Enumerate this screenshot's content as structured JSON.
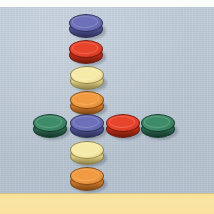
{
  "scene": {
    "title": "Checkers pieces arranged in a cross on a blue-grey table",
    "width": 214,
    "height": 214,
    "background_color": "#b7c4d1",
    "top_band_color": "#fcfdfd",
    "bottom_band_color": "#f9e2a0",
    "top_band_height": 7,
    "bottom_band_top": 193,
    "bottom_band_height": 21
  },
  "palette": {
    "blue": "#6d70b8",
    "blue_dark": "#4b4e8c",
    "blue_outline": "#2d2f55",
    "red": "#e8442c",
    "red_dark": "#b32a17",
    "red_outline": "#6f1a0d",
    "cream": "#f6eaa8",
    "cream_dark": "#d9c97f",
    "cream_outline": "#8d8248",
    "orange": "#f09a41",
    "orange_dark": "#c9752a",
    "orange_outline": "#7d4613",
    "green": "#3f8c6a",
    "green_dark": "#2a6149",
    "green_outline": "#15392a"
  },
  "checkers": [
    {
      "id": "col-1",
      "label": "blue checker top of column",
      "color": "blue",
      "x": 69,
      "y": 14,
      "w": 34,
      "h": 18,
      "thickness": 6
    },
    {
      "id": "col-2",
      "label": "red checker in column",
      "color": "red",
      "x": 69,
      "y": 40,
      "w": 34,
      "h": 18,
      "thickness": 6
    },
    {
      "id": "col-3",
      "label": "cream checker in column",
      "color": "cream",
      "x": 70,
      "y": 66,
      "w": 34,
      "h": 18,
      "thickness": 6
    },
    {
      "id": "col-4",
      "label": "orange checker in column",
      "color": "orange",
      "x": 70,
      "y": 91,
      "w": 34,
      "h": 18,
      "thickness": 6
    },
    {
      "id": "row-1",
      "label": "green checker far left of row",
      "color": "green",
      "x": 33,
      "y": 114,
      "w": 34,
      "h": 18,
      "thickness": 6
    },
    {
      "id": "mid",
      "label": "blue checker at cross centre",
      "color": "blue",
      "x": 70,
      "y": 114,
      "w": 34,
      "h": 18,
      "thickness": 6
    },
    {
      "id": "row-3",
      "label": "red checker right of centre",
      "color": "red",
      "x": 106,
      "y": 114,
      "w": 34,
      "h": 18,
      "thickness": 6
    },
    {
      "id": "row-4",
      "label": "green checker far right of row",
      "color": "green",
      "x": 141,
      "y": 114,
      "w": 34,
      "h": 18,
      "thickness": 6
    },
    {
      "id": "col-6",
      "label": "cream checker below centre",
      "color": "cream",
      "x": 70,
      "y": 141,
      "w": 34,
      "h": 18,
      "thickness": 6
    },
    {
      "id": "col-7",
      "label": "orange checker bottom of column",
      "color": "orange",
      "x": 70,
      "y": 167,
      "w": 34,
      "h": 18,
      "thickness": 6
    }
  ]
}
